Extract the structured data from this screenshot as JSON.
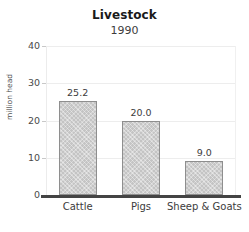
{
  "chart_data": {
    "type": "bar",
    "title": "Livestock",
    "subtitle": "1990",
    "xlabel": "",
    "ylabel": "million head",
    "categories": [
      "Cattle",
      "Pigs",
      "Sheep & Goats"
    ],
    "values": [
      25.2,
      20.0,
      9.0
    ],
    "value_labels": [
      "25.2",
      "20.0",
      "9.0"
    ],
    "ylim": [
      0,
      40
    ],
    "yticks": [
      0,
      10,
      20,
      30,
      40
    ],
    "ytick_labels": [
      "0",
      "10",
      "20",
      "30",
      "40"
    ],
    "grid": "horizontal-faint",
    "legend": "none",
    "colors": {
      "bar_fill": "#c4c4c4",
      "bar_edge": "#8e8e8e",
      "axis": "#444444",
      "grid": "#ededed",
      "text": "#3c3c3c",
      "title": "#1a1a1a",
      "background": "#ffffff"
    }
  }
}
